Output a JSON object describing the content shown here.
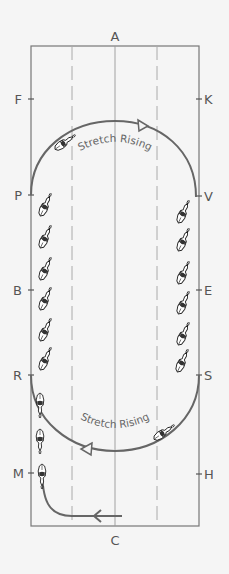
{
  "diagram": {
    "colors": {
      "background": "#f5f5f5",
      "arena_border": "#777777",
      "dashed_lines": "#aaaaaa",
      "center_line": "#999999",
      "path": "#666666",
      "letters": "#555555"
    },
    "letters": {
      "top": "A",
      "bottom": "C",
      "left": [
        "F",
        "P",
        "B",
        "R",
        "M"
      ],
      "right": [
        "K",
        "V",
        "E",
        "S",
        "H"
      ]
    },
    "labels": {
      "top_circle": "Stretch Rising",
      "bottom_circle": "Stretch Rising"
    }
  }
}
